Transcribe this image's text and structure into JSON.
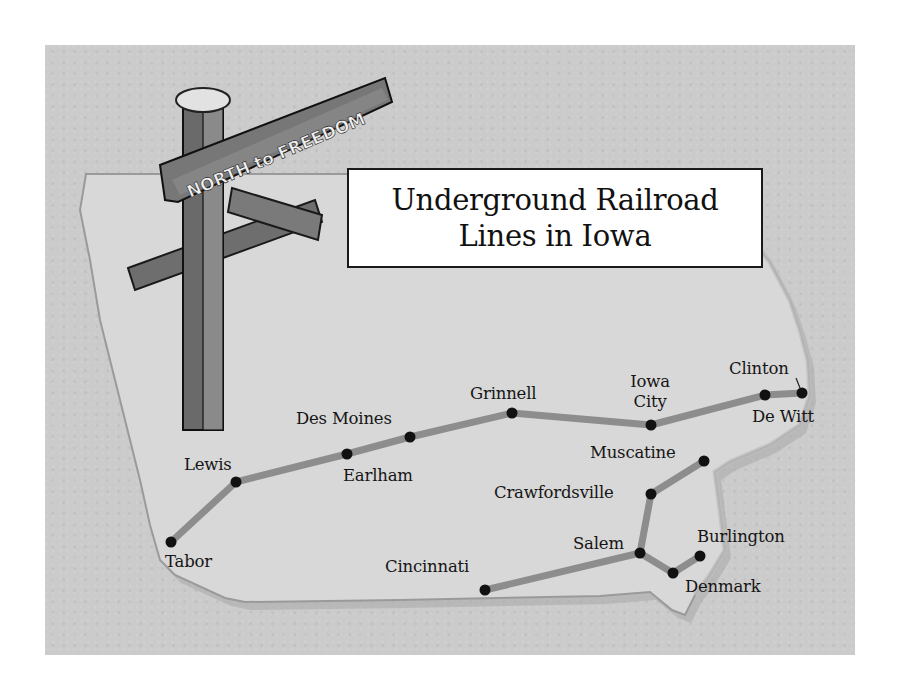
{
  "title": {
    "line1": "Underground Railroad",
    "line2": "Lines in Iowa"
  },
  "signpost": {
    "sign_text": "NORTH to FREEDOM"
  },
  "colors": {
    "background": "#cbcbcb",
    "state_fill": "#d9d9d9",
    "route_line": "#8f8f8f",
    "city_dot": "#111111",
    "title_box": "#ffffff"
  },
  "cities": [
    {
      "name": "Tabor",
      "x": 171,
      "y": 542
    },
    {
      "name": "Lewis",
      "x": 236,
      "y": 482
    },
    {
      "name": "Earlham",
      "x": 347,
      "y": 454
    },
    {
      "name": "Des Moines",
      "x": 410,
      "y": 437
    },
    {
      "name": "Grinnell",
      "x": 512,
      "y": 413
    },
    {
      "name": "Iowa City",
      "x": 651,
      "y": 425
    },
    {
      "name": "De Witt",
      "x": 765,
      "y": 395
    },
    {
      "name": "Clinton",
      "x": 802,
      "y": 393
    },
    {
      "name": "Muscatine",
      "x": 704,
      "y": 461
    },
    {
      "name": "Crawfordsville",
      "x": 651,
      "y": 494
    },
    {
      "name": "Salem",
      "x": 640,
      "y": 553
    },
    {
      "name": "Denmark",
      "x": 673,
      "y": 573
    },
    {
      "name": "Burlington",
      "x": 700,
      "y": 556
    },
    {
      "name": "Cincinnati",
      "x": 485,
      "y": 590
    }
  ],
  "labels": {
    "tabor": "Tabor",
    "lewis": "Lewis",
    "earlham": "Earlham",
    "des_moines": "Des Moines",
    "grinnell": "Grinnell",
    "iowa_city_1": "Iowa",
    "iowa_city_2": "City",
    "de_witt": "De Witt",
    "clinton": "Clinton",
    "muscatine": "Muscatine",
    "crawfordsville": "Crawfordsville",
    "salem": "Salem",
    "denmark": "Denmark",
    "burlington": "Burlington",
    "cincinnati": "Cincinnati"
  },
  "routes": [
    [
      "Tabor",
      "Lewis",
      "Earlham",
      "Des Moines",
      "Grinnell",
      "Iowa City",
      "De Witt",
      "Clinton"
    ],
    [
      "Cincinnati",
      "Salem",
      "Crawfordsville",
      "Muscatine"
    ],
    [
      "Salem",
      "Denmark",
      "Burlington"
    ]
  ]
}
